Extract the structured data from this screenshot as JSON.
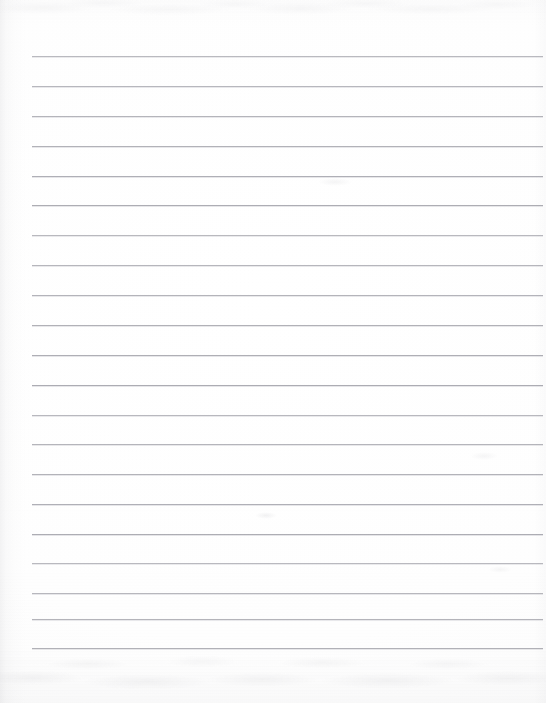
{
  "document": {
    "kind": "scanned-lined-paper",
    "title": "Blank ruled notebook page",
    "content_text": "",
    "page_width": 546,
    "page_height": 703
  },
  "colors": {
    "page_background": "#ffffff",
    "paper_tint": "#fdfdfd",
    "rule_line": "#a9a9b0",
    "rule_line_shadow": "#b4b4bc",
    "edge_shadow": "#7c7c86",
    "smudge": "#949498"
  },
  "ruling": {
    "line_count": 21,
    "first_line_y": 56,
    "line_spacing": 29.6,
    "line_left_x": 32,
    "line_right_x": 543,
    "line_thickness": 1,
    "margin_line_visible": false,
    "lines_y": [
      56,
      86,
      116,
      146,
      176,
      205,
      235,
      265,
      295,
      325,
      355,
      385,
      415,
      444,
      474,
      504,
      534,
      563,
      593,
      619,
      648
    ]
  },
  "artifacts": {
    "top_band_label": "scan-smudge-top",
    "bottom_band_label": "scan-smudge-bottom",
    "left_edge_label": "scan-shadow-left",
    "top_band_height": 26,
    "bottom_band_height": 56
  }
}
